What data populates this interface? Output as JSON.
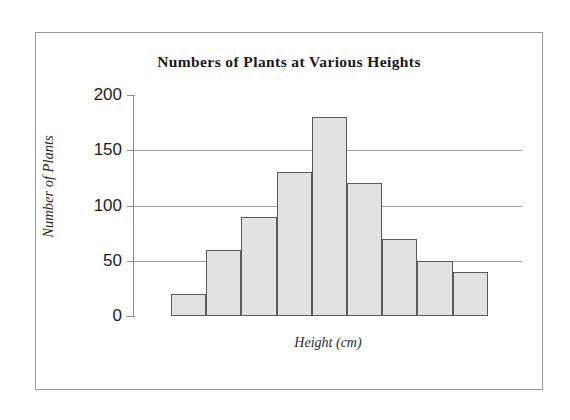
{
  "chart_data": {
    "type": "bar",
    "title": "Numbers of Plants at Various Heights",
    "xlabel": "Height (cm)",
    "ylabel": "Number of Plants",
    "categories": [
      "",
      "",
      "",
      "",
      "",
      "",
      "",
      "",
      ""
    ],
    "values": [
      20,
      60,
      90,
      130,
      180,
      120,
      70,
      50,
      40
    ],
    "ylim": [
      0,
      200
    ],
    "yticks": [
      0,
      50,
      100,
      150,
      200
    ],
    "ytick_labels": [
      "0",
      "50",
      "100",
      "150",
      "200"
    ],
    "gridlines": [
      50,
      100,
      150
    ],
    "grid": true,
    "legend": false,
    "xtick_labels": [],
    "colors": {
      "bar_fill": "#e2e2e2",
      "bar_border": "#5a5a5a",
      "gridline": "#9d9d9d",
      "axis": "#8c8c8c",
      "frame_border": "#9a9a9a",
      "text": "#1a1a1a",
      "background": "#ffffff"
    }
  },
  "figure": {
    "frame_label": "chart-frame"
  }
}
